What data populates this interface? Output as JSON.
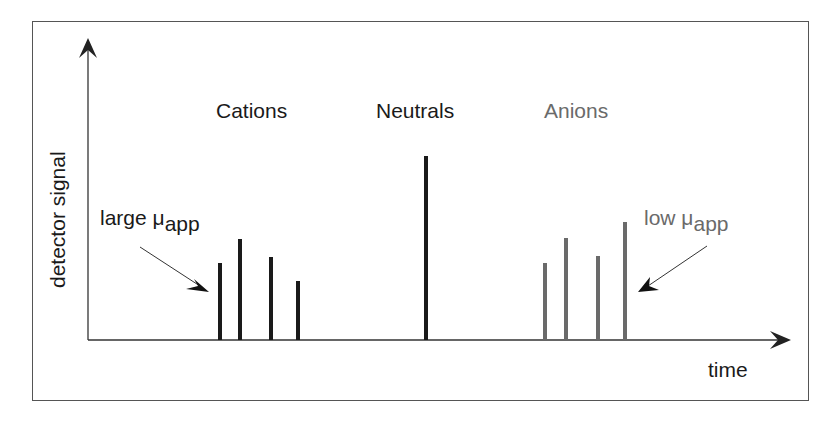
{
  "diagram": {
    "y_axis_label": "detector signal",
    "x_axis_label": "time",
    "groups": {
      "cations": {
        "label": "Cations",
        "color": "#1a1a1a"
      },
      "neutrals": {
        "label": "Neutrals",
        "color": "#1a1a1a"
      },
      "anions": {
        "label": "Anions",
        "color": "#6a6a6a"
      }
    },
    "annotations": {
      "left": {
        "prefix": "large ",
        "mu": "μ",
        "sub": "app"
      },
      "right": {
        "prefix": "low ",
        "mu": "μ",
        "sub": "app"
      }
    }
  },
  "chart_data": {
    "type": "bar",
    "title": "",
    "xlabel": "time",
    "ylabel": "detector signal",
    "series": [
      {
        "name": "Cations",
        "color": "#1a1a1a",
        "x": [
          220,
          240,
          271,
          298
        ],
        "values": [
          77,
          101,
          83,
          59
        ]
      },
      {
        "name": "Neutrals",
        "color": "#1a1a1a",
        "x": [
          426
        ],
        "values": [
          184
        ]
      },
      {
        "name": "Anions",
        "color": "#6a6a6a",
        "x": [
          545,
          566,
          598,
          625
        ],
        "values": [
          77,
          102,
          84,
          118
        ]
      }
    ],
    "annotations": [
      "large μapp (arrow to first cation peak)",
      "low μapp (arrow to last anion peak)"
    ],
    "grid": false,
    "legend": "none"
  }
}
